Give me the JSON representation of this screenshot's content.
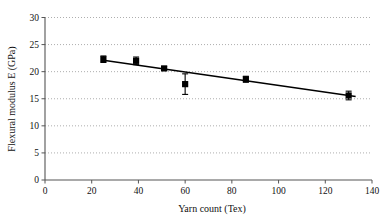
{
  "chart_data": {
    "type": "scatter",
    "title": "",
    "xlabel": "Yarn count (Tex)",
    "ylabel": "Flexural modulus E (GPa)",
    "xlim": [
      0,
      140
    ],
    "ylim": [
      0,
      30
    ],
    "xticks": [
      0,
      20,
      40,
      60,
      80,
      100,
      120,
      140
    ],
    "yticks": [
      0,
      5,
      10,
      15,
      20,
      25,
      30
    ],
    "grid": "horizontal-dotted",
    "legend": "none",
    "marker": "square-filled-black",
    "series": [
      {
        "name": "Flexural modulus",
        "x": [
          25,
          39,
          51,
          60,
          86,
          130
        ],
        "values": [
          22.3,
          22.0,
          20.6,
          17.7,
          18.6,
          15.6
        ],
        "yerr": [
          0.6,
          0.7,
          0.35,
          1.9,
          0.55,
          0.8
        ]
      }
    ],
    "trendline": {
      "type": "linear",
      "x": [
        25,
        133
      ],
      "y": [
        22.1,
        15.4
      ]
    },
    "marker_color": "#000000",
    "line_color": "#000000",
    "grid_color": "#999999",
    "axis_color": "#555555"
  },
  "axis": {
    "x_tick_labels": [
      "0",
      "20",
      "40",
      "60",
      "80",
      "100",
      "120",
      "140"
    ],
    "y_tick_labels": [
      "0",
      "5",
      "10",
      "15",
      "20",
      "25",
      "30"
    ],
    "x_title": "Yarn count (Tex)",
    "y_title": "Flexural modulus E (GPa)"
  }
}
